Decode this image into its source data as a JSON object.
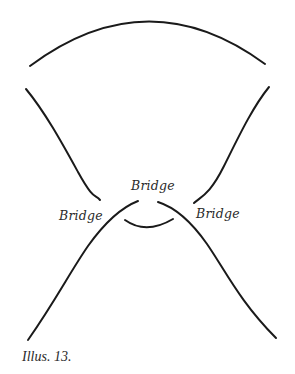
{
  "illustration": {
    "labels": {
      "center": "Bridge",
      "left": "Bridge",
      "right": "Bridge"
    },
    "caption": "Illus. 13.",
    "stroke_color": "#1a1a1a",
    "background_color": "#ffffff"
  }
}
